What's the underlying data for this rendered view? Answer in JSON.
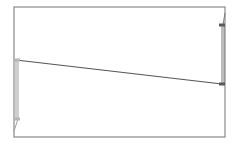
{
  "diagram": {
    "width": 233,
    "height": 147,
    "colors": {
      "background": "#ffffff",
      "frame": "#8a8a8a",
      "line": "#555555",
      "left_post": "#a0a0a0",
      "right_post": "#7a7a7a",
      "marker_light": "#b5b5b5",
      "marker_dark": "#5a5a5a"
    },
    "frame": {
      "x1": 14,
      "y1": 7,
      "x2": 225,
      "y2": 137
    },
    "elements": [
      {
        "type": "connector-line",
        "from": [
          16,
          60
        ],
        "to": [
          222,
          84
        ]
      },
      {
        "type": "left-post",
        "x": 16,
        "y_top": 60,
        "y_bottom": 119,
        "tail_to": [
          14,
          131
        ]
      },
      {
        "type": "right-post",
        "x": 222,
        "y_top": 25,
        "y_bottom": 84,
        "tail_to": [
          225,
          13
        ]
      }
    ],
    "markers": [
      {
        "name": "left-top-marker",
        "x": 17,
        "y": 60,
        "tone": "light"
      },
      {
        "name": "left-bottom-marker",
        "x": 17,
        "y": 119,
        "tone": "light"
      },
      {
        "name": "right-top-marker",
        "x": 222,
        "y": 25,
        "tone": "dark"
      },
      {
        "name": "right-bottom-marker",
        "x": 222,
        "y": 84,
        "tone": "dark"
      }
    ]
  }
}
